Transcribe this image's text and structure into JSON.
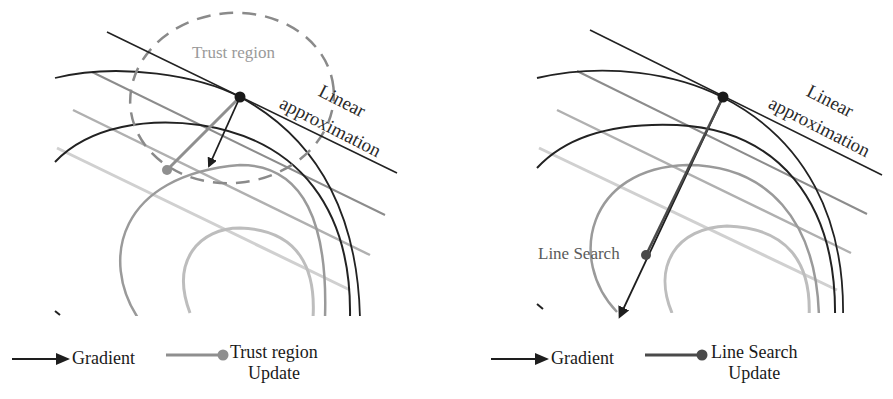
{
  "figure": {
    "panels": [
      {
        "id": "trust-region",
        "labels": {
          "region": "Trust region",
          "linear_line1": "Linear",
          "linear_line2": "approximation"
        },
        "legend": {
          "gradient": "Gradient",
          "update_line1": "Trust region",
          "update_line2": "Update"
        }
      },
      {
        "id": "line-search",
        "labels": {
          "point": "Line Search",
          "linear_line1": "Linear",
          "linear_line2": "approximation"
        },
        "legend": {
          "gradient": "Gradient",
          "update_line1": "Line Search",
          "update_line2": "Update"
        }
      }
    ],
    "colors": {
      "dark_line": "#1e1e1e",
      "mid_gray": "#8c8c8c",
      "light_gray": "#b4b4b4",
      "lighter_gray": "#cfcfcf",
      "dashed_region": "#8a8a8a",
      "trust_update": "#8f8f8f",
      "line_search_update": "#4a4a4a"
    }
  }
}
